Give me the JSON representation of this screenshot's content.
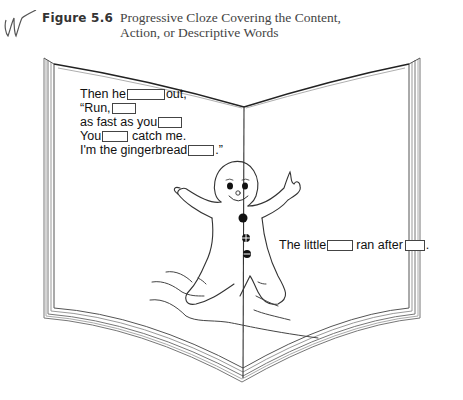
{
  "caption": {
    "figure_label": "Figure 5.6",
    "title_line1": "Progressive Cloze Covering the Content,",
    "title_line2": "Action, or Descriptive Words",
    "decoration_icon": "scribble-icon"
  },
  "left_page": {
    "lines": [
      {
        "before": "Then he",
        "blank_width": 38,
        "after": "out,"
      },
      {
        "before": "“Run,",
        "blank_width": 24,
        "after": ""
      },
      {
        "before": "as fast as you",
        "blank_width": 24,
        "after": ""
      },
      {
        "before": "You",
        "blank_width": 26,
        "after": "catch me."
      },
      {
        "before": "I'm the gingerbread",
        "blank_width": 26,
        "after": ".”"
      }
    ]
  },
  "right_page": {
    "sentence": {
      "part1": "The little",
      "blank1_width": 26,
      "part2": "ran after",
      "blank2_width": 20,
      "part3": "."
    }
  },
  "illustration": {
    "subject": "gingerbread-man-icon",
    "buttons": 3
  },
  "colors": {
    "ink": "#111111",
    "book_edge": "#666666",
    "page": "#ffffff"
  }
}
